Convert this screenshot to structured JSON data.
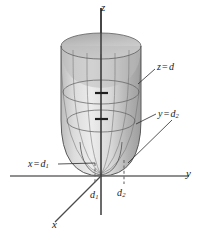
{
  "figure": {
    "type": "3d-surface-diagram",
    "background_color": "#ffffff",
    "surface_color": "#c9c9c9",
    "surface_highlight_color": "#e8e8e8",
    "surface_shadow_color": "#9a9a9a",
    "mesh_color": "#6b6b6b",
    "axis_color": "#3a3a3a",
    "label_color": "#1a1a1a"
  },
  "axes": {
    "z": {
      "label": "z",
      "orientation": "vertical"
    },
    "y": {
      "label": "y",
      "orientation": "horizontal-right"
    },
    "x": {
      "label": "x",
      "orientation": "diagonal-lower-left"
    }
  },
  "ticks": [
    {
      "name": "d1",
      "label": "d",
      "subscript": "1",
      "axis": "x"
    },
    {
      "name": "d2",
      "label": "d",
      "subscript": "2",
      "axis": "y"
    }
  ],
  "trace_labels": [
    {
      "name": "trace-z",
      "lhs": "z",
      "operator": "=",
      "rhs": "d",
      "subscript": ""
    },
    {
      "name": "trace-y",
      "lhs": "y",
      "operator": "=",
      "rhs": "d",
      "subscript": "2"
    },
    {
      "name": "trace-x",
      "lhs": "x",
      "operator": "=",
      "rhs": "d",
      "subscript": "1"
    }
  ]
}
